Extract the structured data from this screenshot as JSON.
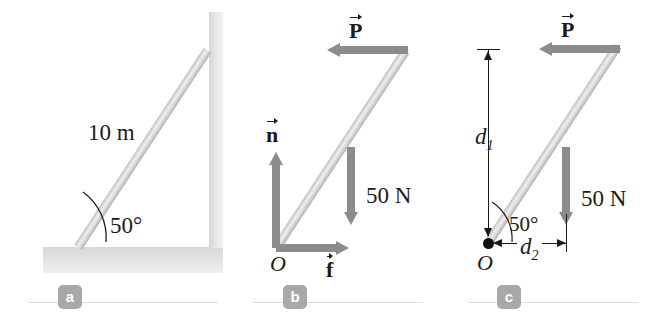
{
  "figure": {
    "colors": {
      "ladder_light": "#efefef",
      "ladder_mid": "#c8c8c8",
      "arrow_gray": "#8c8c8c",
      "line_black": "#1a1a1a",
      "badge_gray": "#a8a8a8",
      "wall_gray": "#e2e2e2",
      "ground_gray": "#e0e0e0"
    }
  },
  "panels": [
    {
      "id": "a",
      "badge": "a",
      "name": "physical-setup",
      "labels": {
        "length": "10 m",
        "angle": "50°"
      }
    },
    {
      "id": "b",
      "badge": "b",
      "name": "free-body-diagram",
      "labels": {
        "origin": "O",
        "weight": "50 N"
      },
      "vectors": [
        {
          "name": "applied-force-p",
          "symbol": "P",
          "direction": "left"
        },
        {
          "name": "normal-force-n",
          "symbol": "n",
          "direction": "up"
        },
        {
          "name": "friction-force-f",
          "symbol": "f",
          "direction": "right"
        },
        {
          "name": "weight-force",
          "symbol": "50 N",
          "direction": "down"
        }
      ]
    },
    {
      "id": "c",
      "badge": "c",
      "name": "torque-diagram",
      "labels": {
        "origin": "O",
        "weight": "50 N",
        "angle": "50°",
        "moment_arm_1": "d",
        "moment_arm_1_sub": "1",
        "moment_arm_2": "d",
        "moment_arm_2_sub": "2"
      },
      "vectors": [
        {
          "name": "applied-force-p",
          "symbol": "P",
          "direction": "left"
        },
        {
          "name": "weight-force",
          "symbol": "50 N",
          "direction": "down"
        }
      ]
    }
  ]
}
